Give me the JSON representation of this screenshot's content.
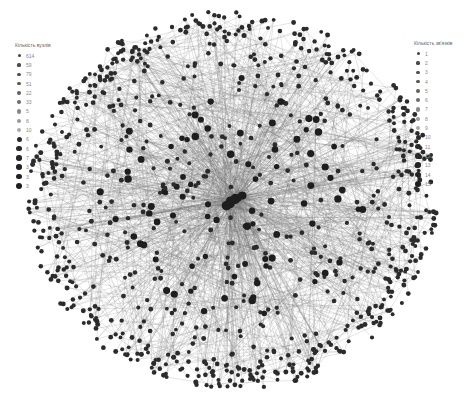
{
  "legend_left": {
    "title": "Кількість вузлів",
    "items": [
      {
        "label": "614",
        "size": 3.0,
        "color": "#444444"
      },
      {
        "label": "59",
        "size": 3.2,
        "color": "#4a4a4a"
      },
      {
        "label": "79",
        "size": 3.4,
        "color": "#505050"
      },
      {
        "label": "51",
        "size": 3.6,
        "color": "#585858"
      },
      {
        "label": "22",
        "size": 3.8,
        "color": "#606060"
      },
      {
        "label": "33",
        "size": 4.0,
        "color": "#6a6a6a"
      },
      {
        "label": "5",
        "size": 4.2,
        "color": "#888888"
      },
      {
        "label": "8",
        "size": 4.4,
        "color": "#999999"
      },
      {
        "label": "10",
        "size": 4.6,
        "color": "#aaaaaa"
      },
      {
        "label": "6",
        "size": 5.0,
        "color": "#2a2a2a"
      },
      {
        "label": "6",
        "size": 5.2,
        "color": "#2a2a2a"
      },
      {
        "label": "7",
        "size": 5.4,
        "color": "#262626"
      },
      {
        "label": "3",
        "size": 5.6,
        "color": "#222222"
      },
      {
        "label": "3",
        "size": 5.8,
        "color": "#222222"
      },
      {
        "label": "3",
        "size": 6.0,
        "color": "#1e1e1e"
      }
    ]
  },
  "legend_right": {
    "title": "Кількість зв'язків",
    "items": [
      {
        "label": "1",
        "size": 3.0,
        "color": "#444444"
      },
      {
        "label": "2",
        "size": 3.2,
        "color": "#4a4a4a"
      },
      {
        "label": "3",
        "size": 3.4,
        "color": "#505050"
      },
      {
        "label": "4",
        "size": 3.6,
        "color": "#585858"
      },
      {
        "label": "5",
        "size": 3.8,
        "color": "#606060"
      },
      {
        "label": "6",
        "size": 4.0,
        "color": "#6a6a6a"
      },
      {
        "label": "7",
        "size": 4.2,
        "color": "#888888"
      },
      {
        "label": "8",
        "size": 4.4,
        "color": "#999999"
      },
      {
        "label": "9",
        "size": 4.6,
        "color": "#aaaaaa"
      },
      {
        "label": "10",
        "size": 5.0,
        "color": "#2a2a2a"
      },
      {
        "label": "11",
        "size": 5.2,
        "color": "#2a2a2a"
      },
      {
        "label": "12",
        "size": 5.4,
        "color": "#262626"
      },
      {
        "label": "13",
        "size": 5.6,
        "color": "#222222"
      },
      {
        "label": "14",
        "size": 5.8,
        "color": "#222222"
      },
      {
        "label": "15",
        "size": 6.0,
        "color": "#1e1e1e"
      }
    ]
  },
  "graph": {
    "center_x": 232,
    "center_y": 200,
    "radius_x": 205,
    "radius_y": 190,
    "node_count": 900,
    "edge_count": 1300,
    "node_color": "#2b2b2b",
    "edge_color": "#777777",
    "seed": 42
  }
}
